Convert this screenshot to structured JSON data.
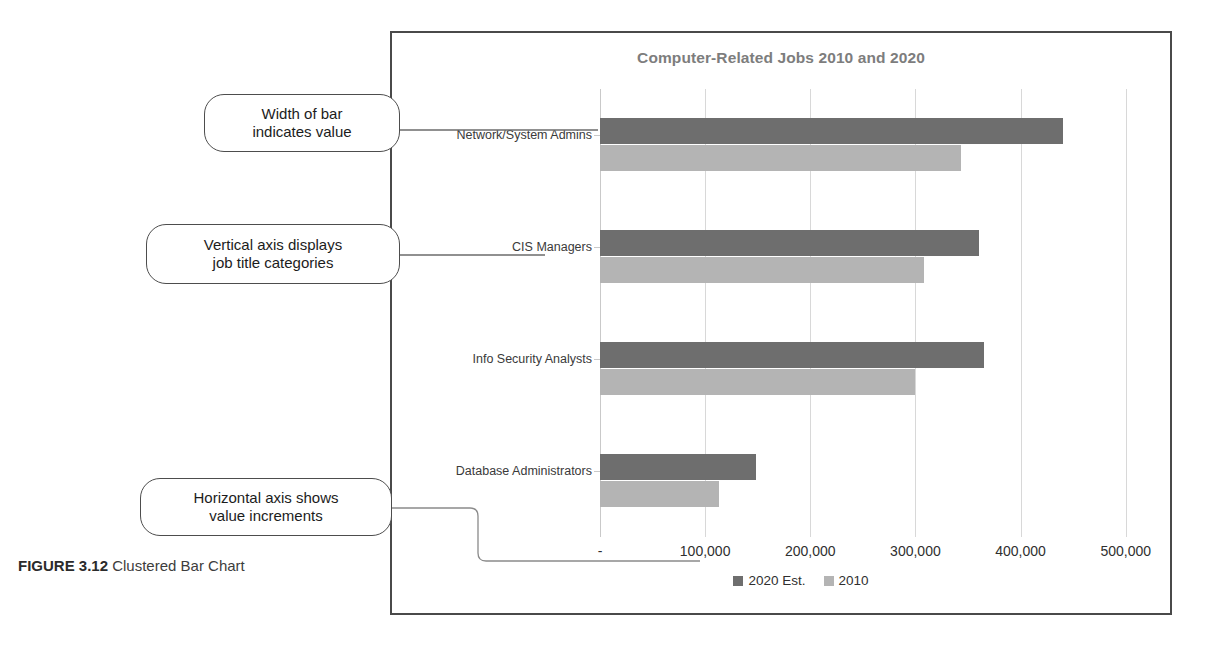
{
  "figure": {
    "number_label": "FIGURE 3.12",
    "caption_text": " Clustered Bar Chart"
  },
  "callouts": [
    {
      "id": "width-of-bar",
      "text": "Width of bar\nindicates value"
    },
    {
      "id": "vertical-axis",
      "text": "Vertical axis displays\njob title categories"
    },
    {
      "id": "horizontal-axis",
      "text": "Horizontal axis shows\nvalue increments"
    }
  ],
  "colors": {
    "series_2020": "#6e6e6e",
    "series_2010": "#b4b4b4",
    "frame": "#4a4a4a",
    "gridline": "#d8d8d8",
    "title": "#7d7d7d"
  },
  "chart_data": {
    "type": "bar",
    "orientation": "horizontal",
    "title": "Computer-Related Jobs 2010 and 2020",
    "xlabel": "",
    "ylabel": "",
    "categories": [
      "Network/System Admins",
      "CIS Managers",
      "Info Security Analysts",
      "Database Administrators"
    ],
    "series": [
      {
        "name": "2020 Est.",
        "color": "#6e6e6e",
        "values": [
          440000,
          360000,
          365000,
          148000
        ]
      },
      {
        "name": "2010",
        "color": "#b4b4b4",
        "values": [
          343000,
          308000,
          300000,
          113000
        ]
      }
    ],
    "xlim": [
      0,
      525000
    ],
    "xticks": [
      0,
      100000,
      200000,
      300000,
      400000,
      500000
    ],
    "xticklabels": [
      "-",
      "100,000",
      "200,000",
      "300,000",
      "400,000",
      "500,000"
    ],
    "grid": true,
    "legend_position": "bottom"
  }
}
